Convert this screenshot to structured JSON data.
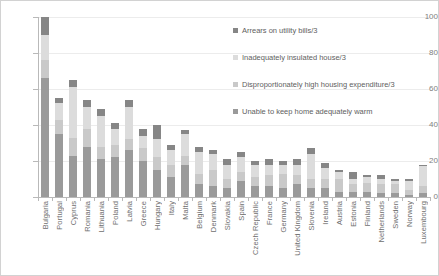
{
  "chart_data": {
    "type": "bar",
    "stacked": true,
    "title": "",
    "subtitle": "",
    "xlabel": "",
    "ylabel": "",
    "ylim": [
      0,
      100
    ],
    "yticks": [
      0,
      20,
      40,
      60,
      80,
      100
    ],
    "grid": true,
    "legend_position": "top-right",
    "categories": [
      "Bulgaria",
      "Portugal",
      "Cyprus",
      "Romania",
      "Lithuania",
      "Poland",
      "Latvia",
      "Greece",
      "Hungary",
      "Italy",
      "Malta",
      "Belgium",
      "Denmark",
      "Slovakia",
      "Spain",
      "Czech Republic",
      "France",
      "Germany",
      "United Kingdom",
      "Slovenia",
      "Ireland",
      "Austria",
      "Estonia",
      "Finland",
      "Netherlands",
      "Sweden",
      "Norway",
      "Luxembourg"
    ],
    "series": [
      {
        "name": "Unable to keep home adequately warm",
        "color": "#9a9a9a",
        "values": [
          66,
          35,
          23,
          28,
          21,
          22,
          26,
          20,
          15,
          11,
          18,
          7,
          6,
          5,
          9,
          6,
          6,
          5,
          7,
          5,
          5,
          3,
          3,
          3,
          2,
          2,
          1,
          2
        ]
      },
      {
        "name": "Disproportionately high housing expenditure/3",
        "color": "#c9c9c9",
        "values": [
          10,
          8,
          10,
          10,
          7,
          7,
          6,
          7,
          7,
          7,
          5,
          6,
          9,
          5,
          5,
          5,
          6,
          8,
          5,
          5,
          5,
          7,
          4,
          5,
          5,
          5,
          3,
          4
        ]
      },
      {
        "name": "Inadequately insulated house/3",
        "color": "#dcdcdc",
        "values": [
          14,
          9,
          28,
          12,
          17,
          9,
          18,
          7,
          10,
          8,
          12,
          12,
          9,
          8,
          8,
          7,
          6,
          5,
          6,
          14,
          6,
          4,
          3,
          3,
          3,
          2,
          5,
          11
        ]
      },
      {
        "name": "Arrears on utility bills/3",
        "color": "#868686",
        "values": [
          10,
          3,
          4,
          4,
          4,
          3,
          4,
          4,
          8,
          3,
          2,
          3,
          2,
          3,
          3,
          2,
          3,
          2,
          3,
          3,
          3,
          1,
          4,
          1,
          2,
          1,
          1,
          1
        ]
      }
    ]
  },
  "legend": {
    "items": [
      {
        "label": "Arrears on utility bills/3",
        "swatch_icon": "legend-swatch-icon"
      },
      {
        "label": "Inadequately insulated house/3",
        "swatch_icon": "legend-swatch-icon"
      },
      {
        "label": "Disproportionately high housing expenditure/3",
        "swatch_icon": "legend-swatch-icon"
      },
      {
        "label": "Unable to keep home adequately warm",
        "swatch_icon": "legend-swatch-icon"
      }
    ]
  },
  "colors": {
    "arrears": "#868686",
    "insulated": "#dcdcdc",
    "expenditure": "#c9c9c9",
    "warm": "#9a9a9a",
    "axis": "#b9b9b9",
    "grid": "#ececec",
    "text": "#6e6e6e",
    "border": "#d2d2d2"
  }
}
